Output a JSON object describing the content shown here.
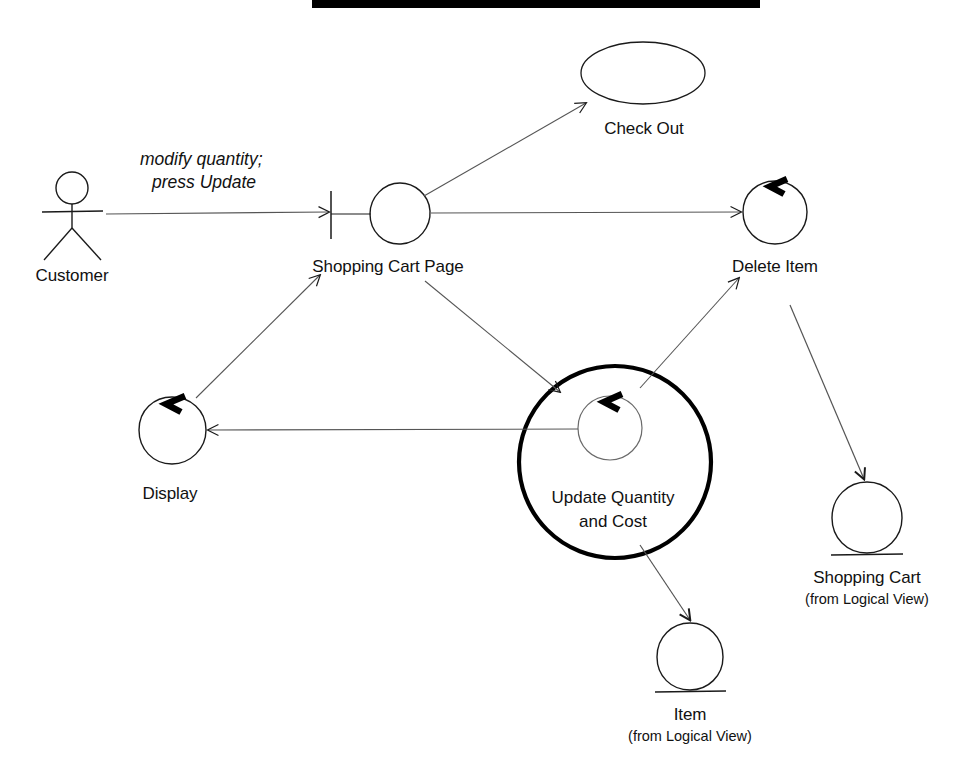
{
  "diagram": {
    "type": "uml-collaboration-diagram",
    "title_bar": {
      "name": "black-redaction-bar",
      "color": "#000000"
    },
    "stroke_color": "#1a1a1a",
    "background": "#ffffff"
  },
  "actors": [
    {
      "id": "customer",
      "label": "Customer",
      "kind": "actor"
    }
  ],
  "use_cases": [
    {
      "id": "check_out",
      "label": "Check Out",
      "kind": "use-case-ellipse"
    }
  ],
  "boundaries": [
    {
      "id": "shopping_cart_page",
      "label": "Shopping Cart Page",
      "kind": "boundary"
    }
  ],
  "controls": [
    {
      "id": "delete_item",
      "label": "Delete Item",
      "kind": "control",
      "selected": false
    },
    {
      "id": "display",
      "label": "Display",
      "kind": "control",
      "selected": false
    },
    {
      "id": "update_quantity_and_cost",
      "label_line1": "Update Quantity",
      "label_line2": "and Cost",
      "kind": "control",
      "selected": true
    }
  ],
  "entities": [
    {
      "id": "shopping_cart",
      "label": "Shopping Cart",
      "sublabel": "(from Logical View)",
      "kind": "entity"
    },
    {
      "id": "item",
      "label": "Item",
      "sublabel": "(from Logical View)",
      "kind": "entity"
    }
  ],
  "messages": [
    {
      "id": "msg_modify_quantity",
      "line1": "modify quantity;",
      "line2": "press Update",
      "from": "customer",
      "to": "shopping_cart_page",
      "style": "italic"
    }
  ],
  "links": [
    {
      "id": "link_customer_to_page",
      "from": "customer",
      "to": "shopping_cart_page",
      "arrow": true
    },
    {
      "id": "link_page_to_checkout",
      "from": "shopping_cart_page",
      "to": "check_out",
      "arrow": true
    },
    {
      "id": "link_page_to_delete_item",
      "from": "shopping_cart_page",
      "to": "delete_item",
      "arrow": true
    },
    {
      "id": "link_page_to_update_quantity",
      "from": "shopping_cart_page",
      "to": "update_quantity_and_cost",
      "arrow": true
    },
    {
      "id": "link_update_quantity_to_delete_item",
      "from": "update_quantity_and_cost",
      "to": "delete_item",
      "arrow": true
    },
    {
      "id": "link_update_quantity_to_display",
      "from": "update_quantity_and_cost",
      "to": "display",
      "arrow": true
    },
    {
      "id": "link_display_to_page",
      "from": "display",
      "to": "shopping_cart_page",
      "arrow": true
    },
    {
      "id": "link_update_quantity_to_item",
      "from": "update_quantity_and_cost",
      "to": "item",
      "arrow": true
    },
    {
      "id": "link_delete_item_to_shopping_cart",
      "from": "delete_item",
      "to": "shopping_cart",
      "arrow": true
    }
  ]
}
